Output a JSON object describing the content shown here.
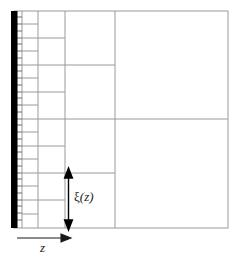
{
  "figure": {
    "type": "mesh-schematic",
    "background_color": "#ffffff",
    "line_color": "#8a8a8a",
    "border_color": "#9a9a9a",
    "wall_color": "#000000",
    "arrow_color": "#000000",
    "text_color": "#1a1a1a"
  },
  "labels": {
    "z_axis": "z",
    "cell_size": {
      "symbol": "ξ",
      "argument": "(z)",
      "full": "ξ(z)"
    }
  },
  "geometry": {
    "domain": {
      "x0": 14,
      "y0": 11,
      "x1": 228,
      "y1": 228
    },
    "wall": {
      "x": 14,
      "y_top": 11,
      "y_bottom": 228,
      "thickness": 7
    },
    "vertical_grid_lines": [
      22,
      38,
      65,
      115,
      228
    ],
    "horizontal_full_span_lines": [
      115
    ],
    "bands": [
      {
        "name": "band-1",
        "x_start": 17,
        "x_end": 22,
        "cell_height": 7
      },
      {
        "name": "band-2",
        "x_start": 22,
        "x_end": 38,
        "cell_height": 14
      },
      {
        "name": "band-3",
        "x_start": 38,
        "x_end": 65,
        "cell_height": 27
      },
      {
        "name": "band-4",
        "x_start": 65,
        "x_end": 115,
        "cell_height": 54
      },
      {
        "name": "band-5",
        "x_start": 115,
        "x_end": 228,
        "cell_height": 108
      }
    ]
  },
  "annotations": {
    "z_arrow": {
      "x_start": 17,
      "x_end": 70,
      "y": 238
    },
    "xi_arrow": {
      "x": 68,
      "y_top": 170,
      "y_bottom": 228
    }
  }
}
